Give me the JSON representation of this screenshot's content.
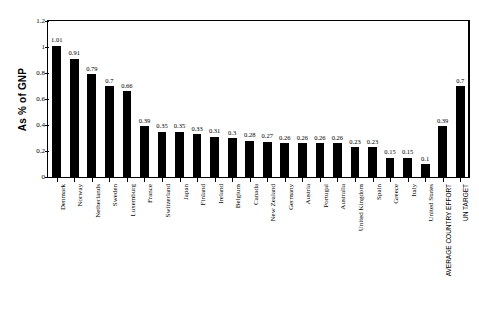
{
  "chart_data": {
    "type": "bar",
    "title": "",
    "xlabel": "",
    "ylabel": "As % of GNP",
    "ylim": [
      0,
      1.2
    ],
    "ytick_values": [
      0,
      0.2,
      0.4,
      0.6,
      0.8,
      1,
      1.2
    ],
    "ytick_labels": [
      "0",
      "0.2",
      "0.4",
      "0.6",
      "0.8",
      "1",
      "1.2"
    ],
    "grid": false,
    "legend": "none",
    "bar_color": "#000000",
    "categories": [
      "Denmark",
      "Norway",
      "Netherlands",
      "Sweden",
      "Luxemburg",
      "France",
      "Switzerland",
      "Japan",
      "Finland",
      "Ireland",
      "Belgium",
      "Canada",
      "New Zealand",
      "Germany",
      "Austria",
      "Portugal",
      "Australia",
      "United Kingdom",
      "Spain",
      "Greece",
      "Italy",
      "United States",
      "AVERAGE COUNTRY EFFORT",
      "UN TARGET"
    ],
    "values": [
      1.01,
      0.91,
      0.79,
      0.7,
      0.66,
      0.39,
      0.35,
      0.35,
      0.33,
      0.31,
      0.3,
      0.28,
      0.27,
      0.26,
      0.26,
      0.26,
      0.26,
      0.23,
      0.23,
      0.15,
      0.15,
      0.1,
      0.39,
      0.7
    ],
    "value_labels": [
      "1.01",
      "0.91",
      "0.79",
      "0.7",
      "0.66",
      "0.39",
      "0.35",
      "0.35",
      "0.33",
      "0.31",
      "0.3",
      "0.28",
      "0.27",
      "0.26",
      "0.26",
      "0.26",
      "0.26",
      "0.23",
      "0.23",
      "0.15",
      "0.15",
      "0.1",
      "0.39",
      "0.7"
    ],
    "uppercase_categories": [
      "AVERAGE COUNTRY EFFORT",
      "UN TARGET"
    ]
  }
}
